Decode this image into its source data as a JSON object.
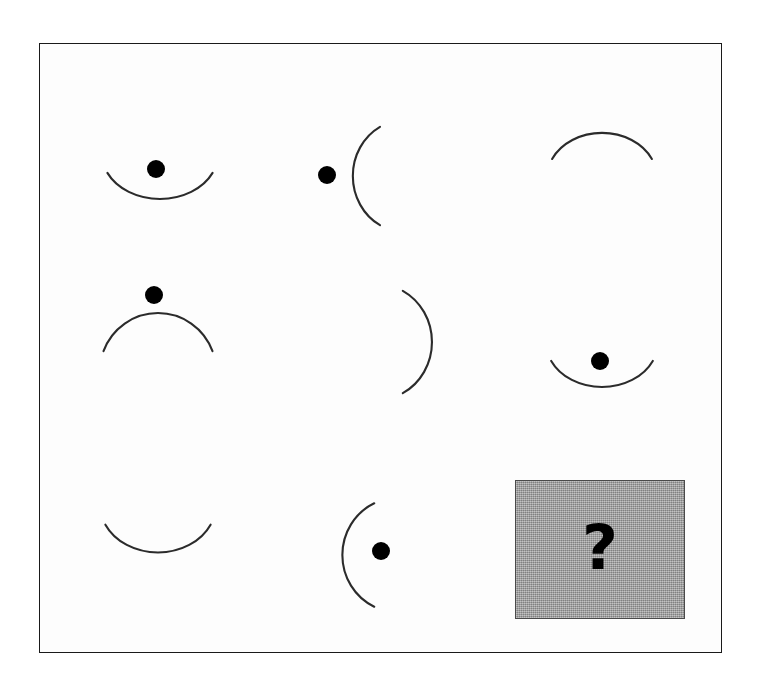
{
  "figure": {
    "kind": "progressive-matrix",
    "rows": 3,
    "columns": 3,
    "frame": {
      "border_color": "#1a1a1a",
      "background_color": "#ffffff",
      "x": 39,
      "y": 43,
      "width": 683,
      "height": 610
    },
    "stroke_color": "#2b2b2b",
    "dot_color": "#000000"
  },
  "cells": [
    {
      "id": "r1c1",
      "row": 1,
      "column": 1,
      "arc_opening": "up",
      "arc_label": "U-shaped arc opening upward",
      "has_dot": true,
      "dot_position": "above-center-inside-opening",
      "box": {
        "x": 90,
        "y": 150,
        "width": 140,
        "height": 100
      },
      "arc": {
        "cx": 70,
        "cy": 42,
        "rx": 58,
        "ry": 45,
        "start_deg": 205,
        "end_deg": 335
      },
      "dot": {
        "cx": 66,
        "cy": 19,
        "r": 9
      }
    },
    {
      "id": "r1c2",
      "row": 1,
      "column": 2,
      "arc_opening": "right",
      "arc_label": "C-shaped arc opening right",
      "has_dot": true,
      "dot_position": "left-outside-convex-side",
      "box": {
        "x": 300,
        "y": 112,
        "width": 140,
        "height": 128
      },
      "arc": {
        "cx": 102,
        "cy": 64,
        "rx": 52,
        "ry": 56,
        "start_deg": 115,
        "end_deg": 245
      },
      "dot": {
        "cx": 27,
        "cy": 63,
        "r": 9
      }
    },
    {
      "id": "r1c3",
      "row": 1,
      "column": 3,
      "arc_opening": "down",
      "arc_label": "Inverted-U arc opening downward",
      "has_dot": false,
      "dot_position": "none",
      "box": {
        "x": 540,
        "y": 108,
        "width": 140,
        "height": 100
      },
      "arc": {
        "cx": 62,
        "cy": 70,
        "rx": 55,
        "ry": 45,
        "start_deg": 25,
        "end_deg": 155
      },
      "dot": null
    },
    {
      "id": "r2c1",
      "row": 2,
      "column": 1,
      "arc_opening": "down",
      "arc_label": "Inverted-U arc opening downward",
      "has_dot": true,
      "dot_position": "above-outside-convex-side",
      "box": {
        "x": 90,
        "y": 278,
        "width": 140,
        "height": 105
      },
      "arc": {
        "cx": 68,
        "cy": 93,
        "rx": 58,
        "ry": 58,
        "start_deg": 20,
        "end_deg": 160
      },
      "dot": {
        "cx": 64,
        "cy": 17,
        "r": 9
      }
    },
    {
      "id": "r2c2",
      "row": 2,
      "column": 2,
      "arc_opening": "left",
      "arc_label": "Reverse-C arc opening left",
      "has_dot": false,
      "dot_position": "none",
      "box": {
        "x": 355,
        "y": 280,
        "width": 140,
        "height": 130
      },
      "arc": {
        "cx": 22,
        "cy": 62,
        "rx": 55,
        "ry": 58,
        "start_deg": -62,
        "end_deg": 62
      },
      "dot": null
    },
    {
      "id": "r2c3",
      "row": 2,
      "column": 3,
      "arc_opening": "up",
      "arc_label": "U-shaped arc opening upward",
      "has_dot": true,
      "dot_position": "above-center-inside-opening",
      "box": {
        "x": 540,
        "y": 338,
        "width": 140,
        "height": 100
      },
      "arc": {
        "cx": 62,
        "cy": 42,
        "rx": 56,
        "ry": 45,
        "start_deg": 205,
        "end_deg": 335
      },
      "dot": {
        "cx": 60,
        "cy": 23,
        "r": 9
      }
    },
    {
      "id": "r3c1",
      "row": 3,
      "column": 1,
      "arc_opening": "up",
      "arc_label": "U-shaped arc opening upward",
      "has_dot": false,
      "dot_position": "none",
      "box": {
        "x": 90,
        "y": 515,
        "width": 140,
        "height": 100
      },
      "arc": {
        "cx": 68,
        "cy": 30,
        "rx": 58,
        "ry": 48,
        "start_deg": 205,
        "end_deg": 335
      },
      "dot": null
    },
    {
      "id": "r3c2",
      "row": 3,
      "column": 2,
      "arc_opening": "right",
      "arc_label": "C-shaped arc opening right",
      "has_dot": true,
      "dot_position": "right-inside-concave-side",
      "box": {
        "x": 315,
        "y": 495,
        "width": 140,
        "height": 128
      },
      "arc": {
        "cx": 82,
        "cy": 60,
        "rx": 55,
        "ry": 57,
        "start_deg": 115,
        "end_deg": 245
      },
      "dot": {
        "cx": 66,
        "cy": 56,
        "r": 9
      }
    }
  ],
  "answer_cell": {
    "id": "r3c3",
    "row": 3,
    "column": 3,
    "label": "?",
    "is_missing": true,
    "background_color": "#9d9d9d",
    "border_color": "#4a4a4a",
    "text_color": "#000000"
  }
}
